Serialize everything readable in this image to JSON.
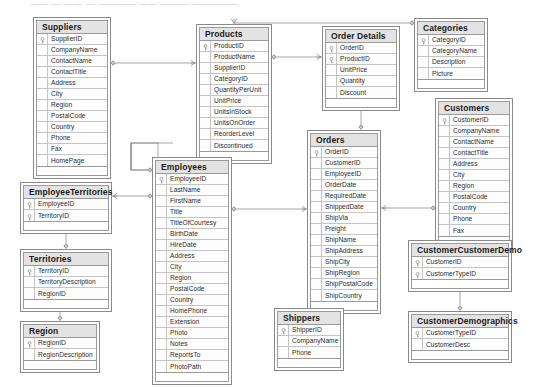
{
  "diagram": {
    "top_artifact_text": "—— — —— — ————  —— ——— —————",
    "colors": {
      "header_fill": "#e3e3e3",
      "border": "#8a8a8a",
      "cell_border": "#c4c4c4",
      "text": "#2b2b2b",
      "link": "#808080",
      "background": "#ffffff"
    },
    "notation": "crows-foot",
    "key_icon": "primary-key-icon"
  },
  "entities": [
    {
      "id": "suppliers",
      "name": "Suppliers",
      "x": 33,
      "y": 17,
      "w": 78,
      "columns": [
        {
          "name": "SupplierID",
          "pk": true
        },
        {
          "name": "CompanyName",
          "pk": false
        },
        {
          "name": "ContactName",
          "pk": false
        },
        {
          "name": "ContactTitle",
          "pk": false
        },
        {
          "name": "Address",
          "pk": false
        },
        {
          "name": "City",
          "pk": false
        },
        {
          "name": "Region",
          "pk": false
        },
        {
          "name": "PostalCode",
          "pk": false
        },
        {
          "name": "Country",
          "pk": false
        },
        {
          "name": "Phone",
          "pk": false
        },
        {
          "name": "Fax",
          "pk": false
        },
        {
          "name": "HomePage",
          "pk": false
        }
      ]
    },
    {
      "id": "products",
      "name": "Products",
      "x": 196,
      "y": 24,
      "w": 76,
      "columns": [
        {
          "name": "ProductID",
          "pk": true
        },
        {
          "name": "ProductName",
          "pk": false
        },
        {
          "name": "SupplierID",
          "pk": false
        },
        {
          "name": "CategoryID",
          "pk": false
        },
        {
          "name": "QuantityPerUnit",
          "pk": false
        },
        {
          "name": "UnitPrice",
          "pk": false
        },
        {
          "name": "UnitsInStock",
          "pk": false
        },
        {
          "name": "UnitsOnOrder",
          "pk": false
        },
        {
          "name": "ReorderLevel",
          "pk": false
        },
        {
          "name": "Discontinued",
          "pk": false
        }
      ]
    },
    {
      "id": "order_details",
      "name": "Order Details",
      "x": 322,
      "y": 26,
      "w": 78,
      "columns": [
        {
          "name": "OrderID",
          "pk": true
        },
        {
          "name": "ProductID",
          "pk": true
        },
        {
          "name": "UnitPrice",
          "pk": false
        },
        {
          "name": "Quantity",
          "pk": false
        },
        {
          "name": "Discount",
          "pk": false
        }
      ]
    },
    {
      "id": "categories",
      "name": "Categories",
      "x": 414,
      "y": 18,
      "w": 74,
      "columns": [
        {
          "name": "CategoryID",
          "pk": true
        },
        {
          "name": "CategoryName",
          "pk": false
        },
        {
          "name": "Description",
          "pk": false
        },
        {
          "name": "Picture",
          "pk": false
        }
      ]
    },
    {
      "id": "customers",
      "name": "Customers",
      "x": 435,
      "y": 98,
      "w": 78,
      "columns": [
        {
          "name": "CustomerID",
          "pk": true
        },
        {
          "name": "CompanyName",
          "pk": false
        },
        {
          "name": "ContactName",
          "pk": false
        },
        {
          "name": "ContactTitle",
          "pk": false
        },
        {
          "name": "Address",
          "pk": false
        },
        {
          "name": "City",
          "pk": false
        },
        {
          "name": "Region",
          "pk": false
        },
        {
          "name": "PostalCode",
          "pk": false
        },
        {
          "name": "Country",
          "pk": false
        },
        {
          "name": "Phone",
          "pk": false
        },
        {
          "name": "Fax",
          "pk": false
        }
      ]
    },
    {
      "id": "orders",
      "name": "Orders",
      "x": 307,
      "y": 130,
      "w": 74,
      "columns": [
        {
          "name": "OrderID",
          "pk": true
        },
        {
          "name": "CustomerID",
          "pk": false
        },
        {
          "name": "EmployeeID",
          "pk": false
        },
        {
          "name": "OrderDate",
          "pk": false
        },
        {
          "name": "RequiredDate",
          "pk": false
        },
        {
          "name": "ShippedDate",
          "pk": false
        },
        {
          "name": "ShipVia",
          "pk": false
        },
        {
          "name": "Freight",
          "pk": false
        },
        {
          "name": "ShipName",
          "pk": false
        },
        {
          "name": "ShipAddress",
          "pk": false
        },
        {
          "name": "ShipCity",
          "pk": false
        },
        {
          "name": "ShipRegion",
          "pk": false
        },
        {
          "name": "ShipPostalCode",
          "pk": false
        },
        {
          "name": "ShipCountry",
          "pk": false
        }
      ]
    },
    {
      "id": "employees",
      "name": "Employees",
      "x": 152,
      "y": 157,
      "w": 80,
      "columns": [
        {
          "name": "EmployeeID",
          "pk": true
        },
        {
          "name": "LastName",
          "pk": false
        },
        {
          "name": "FirstName",
          "pk": false
        },
        {
          "name": "Title",
          "pk": false
        },
        {
          "name": "TitleOfCourtesy",
          "pk": false
        },
        {
          "name": "BirthDate",
          "pk": false
        },
        {
          "name": "HireDate",
          "pk": false
        },
        {
          "name": "Address",
          "pk": false
        },
        {
          "name": "City",
          "pk": false
        },
        {
          "name": "Region",
          "pk": false
        },
        {
          "name": "PostalCode",
          "pk": false
        },
        {
          "name": "Country",
          "pk": false
        },
        {
          "name": "HomePhone",
          "pk": false
        },
        {
          "name": "Extension",
          "pk": false
        },
        {
          "name": "Photo",
          "pk": false
        },
        {
          "name": "Notes",
          "pk": false
        },
        {
          "name": "ReportsTo",
          "pk": false
        },
        {
          "name": "PhotoPath",
          "pk": false
        }
      ]
    },
    {
      "id": "employee_territories",
      "name": "EmployeeTerritories",
      "x": 20,
      "y": 182,
      "w": 92,
      "columns": [
        {
          "name": "EmployeeID",
          "pk": true
        },
        {
          "name": "TerritoryID",
          "pk": true
        }
      ]
    },
    {
      "id": "territories",
      "name": "Territories",
      "x": 20,
      "y": 249,
      "w": 92,
      "columns": [
        {
          "name": "TerritoryID",
          "pk": true
        },
        {
          "name": "TerritoryDescription",
          "pk": false
        },
        {
          "name": "RegionID",
          "pk": false
        }
      ]
    },
    {
      "id": "region",
      "name": "Region",
      "x": 20,
      "y": 321,
      "w": 80,
      "columns": [
        {
          "name": "RegionID",
          "pk": true
        },
        {
          "name": "RegionDescription",
          "pk": false
        }
      ]
    },
    {
      "id": "shippers",
      "name": "Shippers",
      "x": 274,
      "y": 308,
      "w": 70,
      "columns": [
        {
          "name": "ShipperID",
          "pk": true
        },
        {
          "name": "CompanyName",
          "pk": false
        },
        {
          "name": "Phone",
          "pk": false
        }
      ]
    },
    {
      "id": "customer_customer_demo",
      "name": "CustomerCustomerDemo",
      "x": 408,
      "y": 240,
      "w": 104,
      "columns": [
        {
          "name": "CustomerID",
          "pk": true
        },
        {
          "name": "CustomerTypeID",
          "pk": true
        }
      ]
    },
    {
      "id": "customer_demographics",
      "name": "CustomerDemographics",
      "x": 408,
      "y": 311,
      "w": 104,
      "columns": [
        {
          "name": "CustomerTypeID",
          "pk": true
        },
        {
          "name": "CustomerDesc",
          "pk": false
        }
      ]
    }
  ],
  "relationships": [
    {
      "id": "rel-suppliers-products",
      "from": "Suppliers",
      "to": "Products",
      "from_card": "one",
      "to_card": "many"
    },
    {
      "id": "rel-categories-products",
      "from": "Categories",
      "to": "Products",
      "from_card": "one",
      "to_card": "many"
    },
    {
      "id": "rel-products-order-details",
      "from": "Products",
      "to": "Order Details",
      "from_card": "one",
      "to_card": "many"
    },
    {
      "id": "rel-orders-order-details",
      "from": "Orders",
      "to": "Order Details",
      "from_card": "one",
      "to_card": "many"
    },
    {
      "id": "rel-customers-orders",
      "from": "Customers",
      "to": "Orders",
      "from_card": "one",
      "to_card": "many"
    },
    {
      "id": "rel-employees-orders",
      "from": "Employees",
      "to": "Orders",
      "from_card": "one",
      "to_card": "many"
    },
    {
      "id": "rel-shippers-orders",
      "from": "Shippers",
      "to": "Orders",
      "from_card": "one",
      "to_card": "many"
    },
    {
      "id": "rel-employees-employeeterritories",
      "from": "Employees",
      "to": "EmployeeTerritories",
      "from_card": "one",
      "to_card": "many"
    },
    {
      "id": "rel-territories-employeeterritories",
      "from": "Territories",
      "to": "EmployeeTerritories",
      "from_card": "one",
      "to_card": "many"
    },
    {
      "id": "rel-region-territories",
      "from": "Region",
      "to": "Territories",
      "from_card": "one",
      "to_card": "many"
    },
    {
      "id": "rel-customers-customercustomerdemo",
      "from": "Customers",
      "to": "CustomerCustomerDemo",
      "from_card": "one",
      "to_card": "many"
    },
    {
      "id": "rel-customerdemographics-customercustomerdemo",
      "from": "CustomerDemographics",
      "to": "CustomerCustomerDemo",
      "from_card": "one",
      "to_card": "many"
    },
    {
      "id": "rel-employees-employees",
      "from": "Employees",
      "to": "Employees",
      "from_card": "one",
      "to_card": "many"
    }
  ]
}
